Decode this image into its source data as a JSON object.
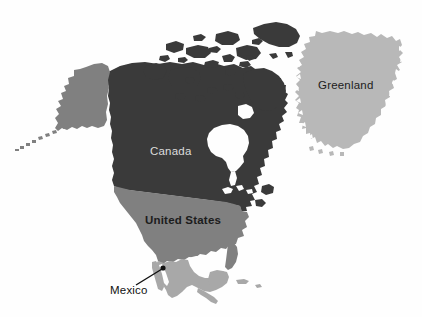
{
  "figure": {
    "background_color": "#fefefe"
  },
  "map": {
    "projection_hint": "north-america-orthographic",
    "regions": [
      {
        "id": "canada",
        "label": "Canada",
        "fill": "#3a3a3a",
        "label_color": "#dcdcdc",
        "label_x": 150,
        "label_y": 146,
        "label_placement": "inside"
      },
      {
        "id": "united-states",
        "label": "United States",
        "fill": "#808080",
        "label_color": "#1c1c1c",
        "label_x": 145,
        "label_y": 215,
        "label_placement": "inside"
      },
      {
        "id": "alaska",
        "label": "",
        "fill": "#808080",
        "label_placement": "none"
      },
      {
        "id": "mexico",
        "label": "Mexico",
        "fill": "#a8a8a8",
        "label_color": "#111111",
        "label_x": 110,
        "label_y": 285,
        "label_placement": "outside-with-leader"
      },
      {
        "id": "greenland",
        "label": "Greenland",
        "fill": "#b8b8b8",
        "label_color": "#1c1c1c",
        "label_x": 318,
        "label_y": 80,
        "label_placement": "inside"
      }
    ],
    "leader_line": {
      "id": "mexico-leader",
      "from_x": 136,
      "from_y": 285,
      "to_x": 163,
      "to_y": 268,
      "color": "#111111",
      "dot_radius": 2.6
    },
    "water_features": [
      {
        "id": "hudson-bay",
        "name": "Hudson Bay"
      },
      {
        "id": "gulf-of-mexico",
        "name": "Gulf of Mexico"
      },
      {
        "id": "great-lakes",
        "name": "Great Lakes"
      }
    ]
  }
}
